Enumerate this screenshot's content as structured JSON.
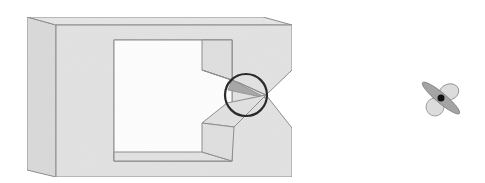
{
  "figure": {
    "colors": {
      "face_fill": "#e3e3e3",
      "side_fill": "#d9d9d9",
      "edge_stroke": "#8a8a8a",
      "shadow_fill": "#a9a9a9",
      "circle_stroke": "#2a2a2a",
      "lobe_dark": "#9a9a9a",
      "lobe_light": "#dcdcdc",
      "center_dot": "#111111"
    },
    "elements": [
      {
        "name": "frame-block",
        "label": ""
      },
      {
        "name": "notch-highlight-circle",
        "label": ""
      },
      {
        "name": "propeller-symbol",
        "label": ""
      }
    ]
  }
}
